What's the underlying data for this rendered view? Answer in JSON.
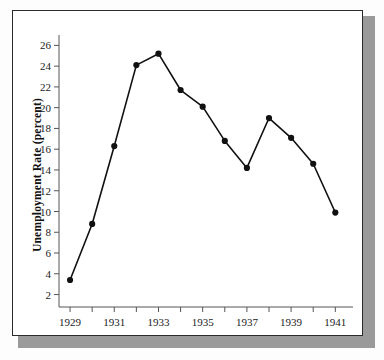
{
  "chart_data": {
    "type": "line",
    "title": "",
    "subtitle": "",
    "xlabel": "",
    "ylabel": "Unemployment Rate (percent)",
    "x": [
      1929,
      1930,
      1931,
      1932,
      1933,
      1934,
      1935,
      1936,
      1937,
      1938,
      1939,
      1940,
      1941
    ],
    "values": [
      3.4,
      8.8,
      16.3,
      24.1,
      25.2,
      21.7,
      20.1,
      16.8,
      14.2,
      19.0,
      17.1,
      14.6,
      9.9
    ],
    "series": [
      {
        "name": "Unemployment Rate (percent)",
        "values": [
          3.4,
          8.8,
          16.3,
          24.1,
          25.2,
          21.7,
          20.1,
          16.8,
          14.2,
          19.0,
          17.1,
          14.6,
          9.9
        ]
      }
    ],
    "xlim": [
      1928.5,
      1941.8
    ],
    "ylim": [
      0.8,
      27.0
    ],
    "x_major_ticks": [
      1929,
      1931,
      1933,
      1935,
      1937,
      1939,
      1941
    ],
    "x_minor_ticks": [
      1930,
      1932,
      1934,
      1936,
      1938,
      1940
    ],
    "x_tick_labels": [
      "1929",
      "1931",
      "1933",
      "1935",
      "1937",
      "1939",
      "1941"
    ],
    "y_ticks": [
      2,
      4,
      6,
      8,
      10,
      12,
      14,
      16,
      18,
      20,
      22,
      24,
      26
    ],
    "y_tick_labels": [
      "2",
      "4",
      "6",
      "8",
      "10",
      "12",
      "14",
      "16",
      "18",
      "20",
      "22",
      "24",
      "26"
    ],
    "grid": false,
    "legend": false,
    "legend_position": "none",
    "marker": "filled-circle",
    "line_color": "#111111",
    "marker_color": "#111111",
    "axis_color": "#555555",
    "background_color": "#ffffff",
    "border_color": "#2b2b2b",
    "shadow_color": "#9a9a9a"
  }
}
